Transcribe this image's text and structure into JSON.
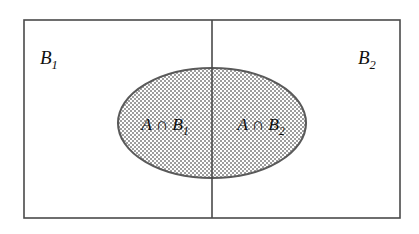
{
  "figure": {
    "type": "set-partition-venn-diagram",
    "background_color": "#ffffff",
    "line_color": "#4a4a4a",
    "ellipse_stroke_color": "#5a5a5a",
    "ellipse_fill": "stipple-dot-pattern",
    "stipple_color": "#9a9a9a",
    "text_color": "#101010"
  },
  "universe": {
    "name": "universe-rectangle",
    "x": 24,
    "y": 20,
    "width": 376,
    "height": 198
  },
  "divider": {
    "name": "vertical-partition-divider",
    "x": 212,
    "y1": 20,
    "y2": 218
  },
  "set_a": {
    "name": "set-a-ellipse",
    "cx": 212,
    "cy": 123,
    "rx": 94,
    "ry": 55
  },
  "labels": {
    "left_region": {
      "base": "B",
      "subscript": "1",
      "full": "B1",
      "x": 40,
      "y": 64
    },
    "right_region": {
      "base": "B",
      "subscript": "2",
      "full": "B2",
      "x": 358,
      "y": 64
    },
    "intersection_left": {
      "set_a": "A",
      "operator": "∩",
      "set_b": "B",
      "subscript": "1",
      "full": "A ∩ B1",
      "x": 165,
      "y": 130
    },
    "intersection_right": {
      "set_a": "A",
      "operator": "∩",
      "set_b": "B",
      "subscript": "2",
      "full": "A ∩ B2",
      "x": 261,
      "y": 130
    }
  }
}
